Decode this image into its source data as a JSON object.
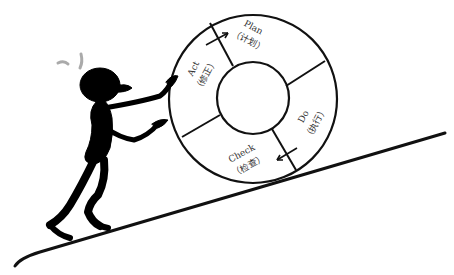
{
  "diagram": {
    "wheel": {
      "segments": [
        {
          "en": "Plan",
          "cn": "（计划）"
        },
        {
          "en": "Do",
          "cn": "（执行）"
        },
        {
          "en": "Check",
          "cn": "（检查）"
        },
        {
          "en": "Act",
          "cn": "（修正）"
        }
      ]
    },
    "figure": "stick figure pushing wheel",
    "colors": {
      "ink": "#111111",
      "background": "#ffffff",
      "sweat": "#aaaaaa"
    }
  }
}
